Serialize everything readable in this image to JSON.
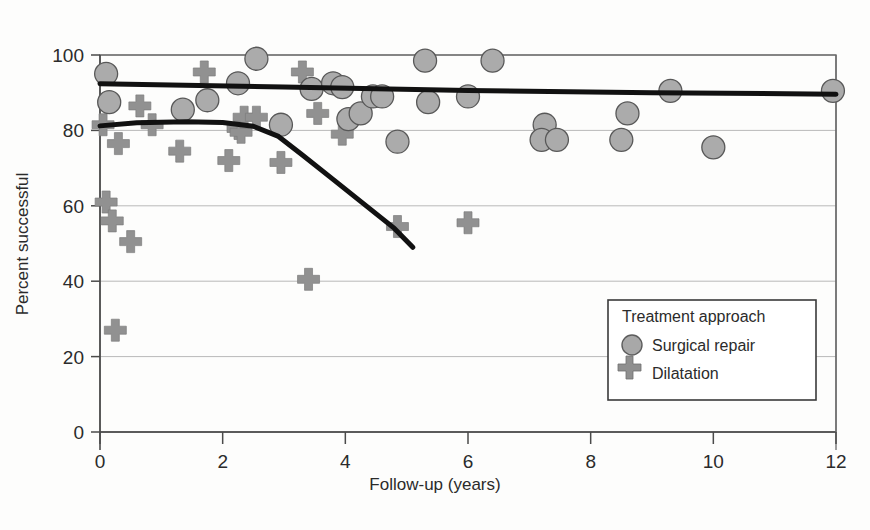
{
  "chart_data": {
    "type": "scatter",
    "title": "",
    "xlabel": "Follow-up (years)",
    "ylabel": "Percent successful",
    "xlim": [
      0,
      12
    ],
    "ylim": [
      0,
      100
    ],
    "xticks": [
      0,
      2,
      4,
      6,
      8,
      10,
      12
    ],
    "yticks": [
      0,
      20,
      40,
      60,
      80,
      100
    ],
    "xtick_labels": [
      "0",
      "2",
      "4",
      "6",
      "8",
      "10",
      "12"
    ],
    "ytick_labels": [
      "0",
      "20",
      "40",
      "60",
      "80",
      "100"
    ],
    "grid": "horizontal",
    "legend": {
      "title": "Treatment approach",
      "position": "bottom-right",
      "entries": [
        {
          "label": "Surgical repair",
          "marker": "circle",
          "color": "#a0a0a0"
        },
        {
          "label": "Dilatation",
          "marker": "plus",
          "color": "#8c8c8c"
        }
      ]
    },
    "series": [
      {
        "name": "Surgical repair",
        "marker": "circle",
        "color": "#a8a8a8",
        "points": [
          {
            "x": 0.1,
            "y": 95
          },
          {
            "x": 0.15,
            "y": 87.5
          },
          {
            "x": 1.35,
            "y": 85.5
          },
          {
            "x": 1.75,
            "y": 88
          },
          {
            "x": 2.25,
            "y": 92.5
          },
          {
            "x": 2.55,
            "y": 99
          },
          {
            "x": 2.95,
            "y": 81.5
          },
          {
            "x": 3.45,
            "y": 91
          },
          {
            "x": 3.8,
            "y": 92.5
          },
          {
            "x": 3.95,
            "y": 91.5
          },
          {
            "x": 4.05,
            "y": 83
          },
          {
            "x": 4.25,
            "y": 84.5
          },
          {
            "x": 4.45,
            "y": 89
          },
          {
            "x": 4.6,
            "y": 89
          },
          {
            "x": 4.85,
            "y": 77
          },
          {
            "x": 5.3,
            "y": 98.5
          },
          {
            "x": 5.35,
            "y": 87.5
          },
          {
            "x": 6.0,
            "y": 89
          },
          {
            "x": 6.4,
            "y": 98.5
          },
          {
            "x": 7.25,
            "y": 81.5
          },
          {
            "x": 7.2,
            "y": 77.5
          },
          {
            "x": 7.45,
            "y": 77.5
          },
          {
            "x": 8.5,
            "y": 77.5
          },
          {
            "x": 8.6,
            "y": 84.5
          },
          {
            "x": 9.3,
            "y": 90.5
          },
          {
            "x": 10.0,
            "y": 75.5
          },
          {
            "x": 11.95,
            "y": 90.5
          }
        ]
      },
      {
        "name": "Dilatation",
        "marker": "plus",
        "color": "#8f8f8f",
        "points": [
          {
            "x": 0.05,
            "y": 81.5
          },
          {
            "x": 0.1,
            "y": 61
          },
          {
            "x": 0.2,
            "y": 56
          },
          {
            "x": 0.25,
            "y": 27
          },
          {
            "x": 0.3,
            "y": 76.5
          },
          {
            "x": 0.5,
            "y": 50.5
          },
          {
            "x": 0.65,
            "y": 86.5
          },
          {
            "x": 0.85,
            "y": 81.5
          },
          {
            "x": 1.3,
            "y": 74.5
          },
          {
            "x": 1.7,
            "y": 95.5
          },
          {
            "x": 2.1,
            "y": 72
          },
          {
            "x": 2.25,
            "y": 80.5
          },
          {
            "x": 2.3,
            "y": 79.5
          },
          {
            "x": 2.35,
            "y": 83.5
          },
          {
            "x": 2.55,
            "y": 83.5
          },
          {
            "x": 2.95,
            "y": 71.5
          },
          {
            "x": 3.3,
            "y": 95.5
          },
          {
            "x": 3.4,
            "y": 40.5
          },
          {
            "x": 3.55,
            "y": 84.5
          },
          {
            "x": 3.95,
            "y": 79
          },
          {
            "x": 4.85,
            "y": 54.5
          },
          {
            "x": 6.0,
            "y": 55.5
          }
        ]
      }
    ],
    "trend_lines": [
      {
        "name": "surgical-trend",
        "style": "thick-solid",
        "color": "#111111",
        "points": [
          {
            "x": 0.0,
            "y": 92.4
          },
          {
            "x": 3.0,
            "y": 91.5
          },
          {
            "x": 6.0,
            "y": 90.6
          },
          {
            "x": 9.0,
            "y": 90.0
          },
          {
            "x": 12.0,
            "y": 89.6
          }
        ]
      },
      {
        "name": "dilatation-trend",
        "style": "thick-solid",
        "color": "#111111",
        "points": [
          {
            "x": 0.0,
            "y": 81.2
          },
          {
            "x": 0.6,
            "y": 82.0
          },
          {
            "x": 1.4,
            "y": 82.3
          },
          {
            "x": 2.0,
            "y": 82.1
          },
          {
            "x": 2.5,
            "y": 81.1
          },
          {
            "x": 2.9,
            "y": 78.5
          },
          {
            "x": 3.3,
            "y": 73.5
          },
          {
            "x": 3.8,
            "y": 67.0
          },
          {
            "x": 4.3,
            "y": 60.5
          },
          {
            "x": 4.8,
            "y": 54.0
          },
          {
            "x": 5.1,
            "y": 49.0
          }
        ]
      }
    ]
  }
}
